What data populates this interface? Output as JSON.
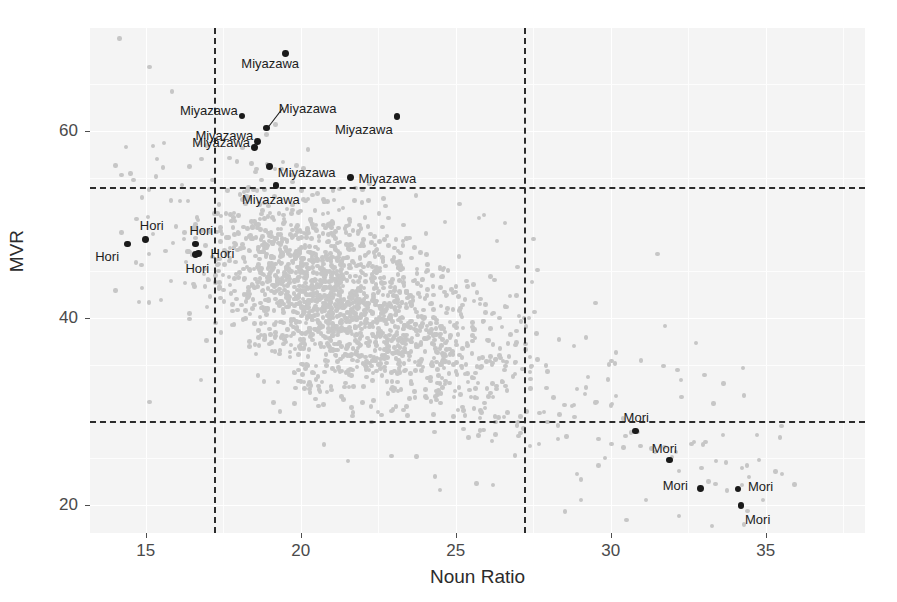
{
  "chart_data": {
    "type": "scatter",
    "title": "",
    "xlabel": "Noun Ratio",
    "ylabel": "MVR",
    "xlim": [
      13.2,
      38.2
    ],
    "ylim": [
      17.0,
      71.0
    ],
    "xticks": [
      15,
      20,
      25,
      30,
      35
    ],
    "xticklabels": [
      "15",
      "20",
      "25",
      "30",
      "35"
    ],
    "yticks": [
      20,
      40,
      60
    ],
    "yticklabels": [
      "20",
      "40",
      "60"
    ],
    "grid": true,
    "legend": null,
    "reference_lines": {
      "horizontal": [
        54.0,
        29.0
      ],
      "vertical": [
        17.2,
        27.2
      ],
      "style": "dashed",
      "color": "#2b2b2b"
    },
    "series": [
      {
        "name": "background-corpus",
        "marker": "circle",
        "color": "#c6c6c6",
        "labeled": false,
        "note": "dense unlabeled cloud of corpus texts"
      },
      {
        "name": "highlighted-authors",
        "marker": "circle",
        "color": "#1a1a1a",
        "labeled": true,
        "points": [
          {
            "label": "Miyazawa",
            "x": 19.5,
            "y": 68.3,
            "lx": -44,
            "ly": 10
          },
          {
            "label": "Miyazawa",
            "x": 18.1,
            "y": 61.6,
            "lx": -62,
            "ly": -6
          },
          {
            "label": "Miyazawa",
            "x": 18.9,
            "y": 60.3,
            "lx": 12,
            "ly": -20,
            "leader": true
          },
          {
            "label": "Miyazawa",
            "x": 23.1,
            "y": 61.5,
            "lx": -62,
            "ly": 12
          },
          {
            "label": "Miyazawa",
            "x": 18.6,
            "y": 58.9,
            "lx": -62,
            "ly": -6
          },
          {
            "label": "Miyazawa",
            "x": 18.5,
            "y": 58.2,
            "lx": -62,
            "ly": -6
          },
          {
            "label": "Miyazawa",
            "x": 19.0,
            "y": 56.2,
            "lx": 8,
            "ly": 6
          },
          {
            "label": "Miyazawa",
            "x": 21.6,
            "y": 55.0,
            "lx": 8,
            "ly": 0
          },
          {
            "label": "Miyazawa",
            "x": 19.2,
            "y": 54.2,
            "lx": -34,
            "ly": 14
          },
          {
            "label": "Hori",
            "x": 14.4,
            "y": 47.9,
            "lx": -32,
            "ly": 12
          },
          {
            "label": "Hori",
            "x": 15.0,
            "y": 48.4,
            "lx": -6,
            "ly": -14
          },
          {
            "label": "Hori",
            "x": 16.6,
            "y": 47.9,
            "lx": -6,
            "ly": -14
          },
          {
            "label": "Hori",
            "x": 16.7,
            "y": 46.9,
            "lx": 12,
            "ly": 0
          },
          {
            "label": "Hori",
            "x": 16.6,
            "y": 46.8,
            "lx": -10,
            "ly": 14
          },
          {
            "label": "Mori",
            "x": 30.8,
            "y": 27.9,
            "lx": -12,
            "ly": -14
          },
          {
            "label": "Mori",
            "x": 31.9,
            "y": 24.8,
            "lx": -18,
            "ly": -12
          },
          {
            "label": "Mori",
            "x": 32.9,
            "y": 21.8,
            "lx": -38,
            "ly": -3
          },
          {
            "label": "Mori",
            "x": 34.1,
            "y": 21.7,
            "lx": 10,
            "ly": -3
          },
          {
            "label": "Mori",
            "x": 34.2,
            "y": 19.9,
            "lx": 4,
            "ly": 13
          }
        ]
      }
    ]
  }
}
